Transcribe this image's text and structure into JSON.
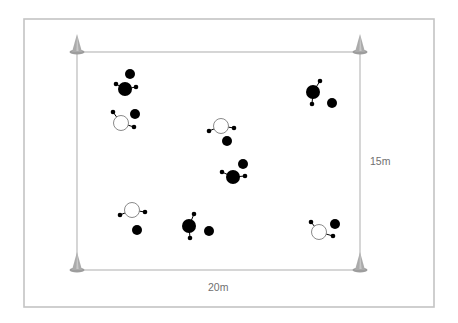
{
  "diagram": {
    "title": "",
    "colors": {
      "frame": "#c4c4c4",
      "field_line": "#b4b4b4",
      "cone": "#ababab",
      "cone_base": "#9d9d9d",
      "player_filled": "#000000",
      "player_open_stroke": "#8a8a8a",
      "label": "#6f6f6f"
    },
    "frame": {
      "x": 24,
      "y": 19,
      "w": 410,
      "h": 288
    },
    "field": {
      "x": 77,
      "y": 52,
      "w": 283,
      "h": 218
    },
    "dimensions": {
      "width_label": "20m",
      "height_label": "15m"
    },
    "cones": [
      {
        "name": "cone-top-left",
        "x": 77,
        "y": 52
      },
      {
        "name": "cone-top-right",
        "x": 360,
        "y": 52
      },
      {
        "name": "cone-bottom-left",
        "x": 77,
        "y": 270
      },
      {
        "name": "cone-bottom-right",
        "x": 360,
        "y": 270
      }
    ],
    "groups": [
      {
        "id": "group-1",
        "body": {
          "type": "filled",
          "x": 125,
          "y": 89,
          "r": 7
        },
        "dots": [
          {
            "x": 116,
            "y": 84
          },
          {
            "x": 136,
            "y": 87
          }
        ],
        "ball": {
          "x": 130,
          "y": 74,
          "r": 5
        }
      },
      {
        "id": "group-2",
        "body": {
          "type": "open",
          "x": 121,
          "y": 123,
          "r": 7.5
        },
        "dots": [
          {
            "x": 113,
            "y": 112
          },
          {
            "x": 134,
            "y": 127
          }
        ],
        "ball": {
          "x": 135,
          "y": 114,
          "r": 5
        }
      },
      {
        "id": "group-3",
        "body": {
          "type": "filled",
          "x": 313,
          "y": 92,
          "r": 7
        },
        "dots": [
          {
            "x": 320,
            "y": 81
          },
          {
            "x": 312,
            "y": 104
          }
        ],
        "ball": {
          "x": 332,
          "y": 103,
          "r": 5
        }
      },
      {
        "id": "group-4",
        "body": {
          "type": "open",
          "x": 221,
          "y": 126,
          "r": 7.5
        },
        "dots": [
          {
            "x": 209,
            "y": 131
          },
          {
            "x": 234,
            "y": 128
          }
        ],
        "ball": {
          "x": 227,
          "y": 141,
          "r": 5
        }
      },
      {
        "id": "group-5",
        "body": {
          "type": "filled",
          "x": 233,
          "y": 177,
          "r": 7
        },
        "dots": [
          {
            "x": 222,
            "y": 172
          },
          {
            "x": 245,
            "y": 176
          }
        ],
        "ball": {
          "x": 243,
          "y": 164,
          "r": 5
        }
      },
      {
        "id": "group-6",
        "body": {
          "type": "open",
          "x": 132,
          "y": 210,
          "r": 7.5
        },
        "dots": [
          {
            "x": 120,
            "y": 215
          },
          {
            "x": 145,
            "y": 212
          }
        ],
        "ball": {
          "x": 137,
          "y": 230,
          "r": 5
        }
      },
      {
        "id": "group-7",
        "body": {
          "type": "filled",
          "x": 189,
          "y": 226,
          "r": 7
        },
        "dots": [
          {
            "x": 194,
            "y": 214
          },
          {
            "x": 190,
            "y": 238
          }
        ],
        "ball": {
          "x": 209,
          "y": 231,
          "r": 5
        }
      },
      {
        "id": "group-8",
        "body": {
          "type": "open",
          "x": 319,
          "y": 232,
          "r": 7.5
        },
        "dots": [
          {
            "x": 311,
            "y": 222
          },
          {
            "x": 333,
            "y": 236
          }
        ],
        "ball": {
          "x": 335,
          "y": 224,
          "r": 5
        }
      }
    ]
  }
}
